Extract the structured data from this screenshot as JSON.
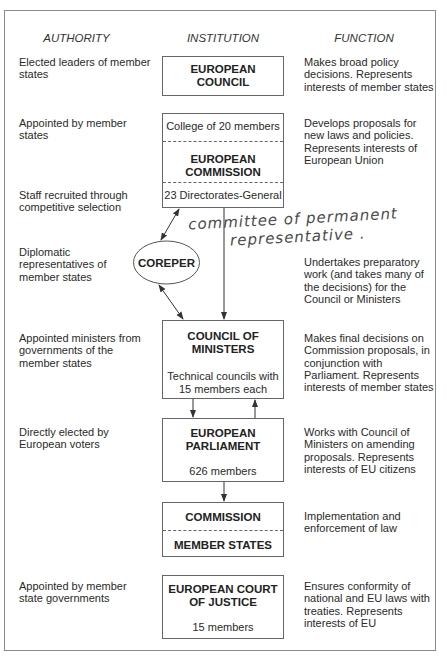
{
  "headers": {
    "authority": "AUTHORITY",
    "institution": "INSTITUTION",
    "function": "FUNCTION"
  },
  "rows": [
    {
      "authority": "Elected leaders of member\nstates",
      "institution": {
        "title": "EUROPEAN\nCOUNCIL"
      },
      "function": "Makes broad policy\ndecisions. Represents\ninterests of member states"
    },
    {
      "authority": "Appointed by member\nstates",
      "institution": {
        "top": "College of 20 members",
        "title": "EUROPEAN\nCOMMISSION",
        "bottom": "23 Directorates-General"
      },
      "function": "Develops proposals for\nnew laws and policies.\nRepresents interests of\nEuropean Union"
    },
    {
      "authority": "Staff recruited through\ncompetitive selection"
    },
    {
      "authority": "Diplomatic\nrepresentatives of\nmember states",
      "institution": {
        "title": "COREPER"
      },
      "function": "Undertakes preparatory\nwork (and takes many of\nthe decisions) for the\nCouncil or Ministers"
    },
    {
      "authority": "Appointed ministers from\ngovernments of the\nmember states",
      "institution": {
        "title": "COUNCIL OF\nMINISTERS",
        "sub": "Technical councils with\n15 members each"
      },
      "function": "Makes final decisions on\nCommission proposals, in\nconjunction with\nParliament. Represents\ninterests of member states"
    },
    {
      "authority": "Directly elected by\nEuropean voters",
      "institution": {
        "title": "EUROPEAN\nPARLIAMENT",
        "sub": "626 members"
      },
      "function": "Works with Council of\nMinisters on amending\nproposals. Represents\ninterests of EU citizens"
    },
    {
      "institution": {
        "top": "COMMISSION",
        "bottom": "MEMBER STATES"
      },
      "function": "Implementation and\nenforcement of law"
    },
    {
      "authority": "Appointed by member\nstate governments",
      "institution": {
        "title": "EUROPEAN COURT\nOF JUSTICE",
        "sub": "15 members"
      },
      "function": "Ensures conformity of\nnational and EU laws with\ntreaties. Represents\ninterests of EU"
    }
  ],
  "annotation": {
    "line1": "committee of permanent",
    "line2": "representative ."
  },
  "colors": {
    "line": "#555555",
    "frame": "#8a8a8a",
    "text": "#222222"
  }
}
